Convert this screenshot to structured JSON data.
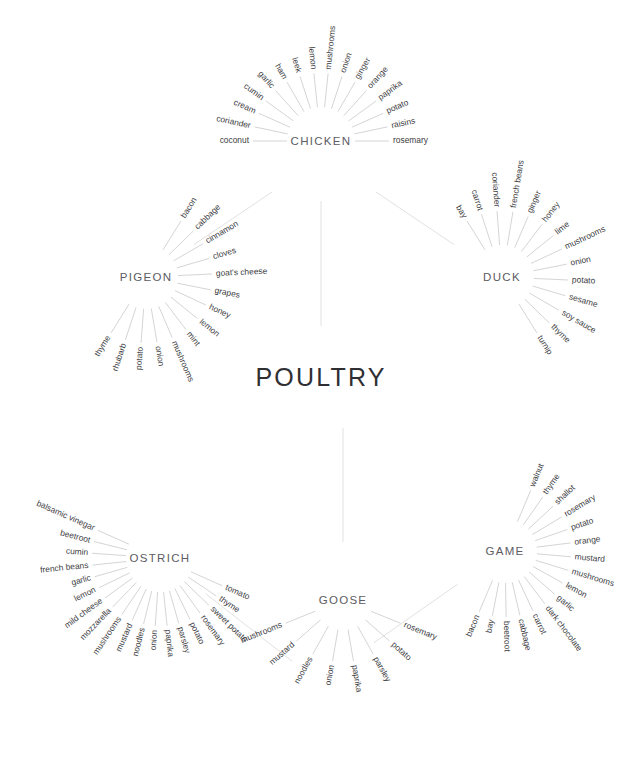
{
  "center": {
    "label": "POULTRY",
    "x": 321,
    "y": 378
  },
  "colors": {
    "background": "#ffffff",
    "center_text": "#2f2f33",
    "cluster_text": "#5c5c62",
    "ingredient_text": "#3c3c42",
    "spoke_line": "#b9b9bd",
    "connector_line": "#dededf"
  },
  "chart_data": {
    "type": "radial-tree",
    "title": "POULTRY",
    "legend": "none",
    "grid": false,
    "cluster_count": 6,
    "clusters": [
      {
        "name": "CHICKEN",
        "cx": 321,
        "cy": 141,
        "label_dx": 0,
        "label_dy": 4,
        "radius_inner": 34,
        "radius_outer": 68,
        "start_angle": 180,
        "end_angle": 360,
        "connector_angle": 90,
        "connector_from": 60,
        "connector_to": 185,
        "count": 16,
        "items": [
          "coconut",
          "coriander",
          "cream",
          "cumin",
          "garlic",
          "ham",
          "leek",
          "lemon",
          "mushrooms",
          "onion",
          "ginger",
          "orange",
          "paprika",
          "potato",
          "raisins",
          "rosemary"
        ]
      },
      {
        "name": "DUCK",
        "cx": 502,
        "cy": 277,
        "label_dx": 0,
        "label_dy": 4,
        "radius_inner": 32,
        "radius_outer": 66,
        "start_angle": 238,
        "end_angle": 418,
        "connector_angle": 214,
        "connector_from": 58,
        "connector_to": 152,
        "count": 14,
        "items": [
          "bay",
          "carrot",
          "coriander",
          "french beans",
          "ginger",
          "honey",
          "lime",
          "mushrooms",
          "onion",
          "potato",
          "sesame",
          "soy sauce",
          "thyme",
          "turnip"
        ]
      },
      {
        "name": "PIGEON",
        "cx": 146,
        "cy": 277,
        "label_dx": 0,
        "label_dy": 4,
        "radius_inner": 32,
        "radius_outer": 66,
        "start_angle": 302,
        "end_angle": 122,
        "connector_angle": 326,
        "connector_from": 58,
        "connector_to": 152,
        "count": 14,
        "items": [
          "bacon",
          "cabbage",
          "cinnamon",
          "cloves",
          "goat's cheese",
          "grapes",
          "honey",
          "lemon",
          "mint",
          "mushrooms",
          "onion",
          "potato",
          "rhubarb",
          "thyme"
        ]
      },
      {
        "name": "OSTRICH",
        "cx": 160,
        "cy": 558,
        "label_dx": 0,
        "label_dy": 4,
        "radius_inner": 34,
        "radius_outer": 68,
        "start_angle": 24,
        "end_angle": 204,
        "connector_angle": 38,
        "connector_from": 58,
        "connector_to": 168,
        "count": 19,
        "items": [
          "tomato",
          "thyme",
          "sweet potato",
          "rosemary",
          "potato",
          "parsley",
          "paprika",
          "onion",
          "noodles",
          "mustard",
          "mushrooms",
          "mozzarella",
          "mild cheese",
          "lemon",
          "garlic",
          "french beans",
          "cumin",
          "beetroot",
          "balsamic vinegar"
        ]
      },
      {
        "name": "GOOSE",
        "cx": 343,
        "cy": 600,
        "label_dx": 0,
        "label_dy": 4,
        "radius_inner": 30,
        "radius_outer": 62,
        "start_angle": 22,
        "end_angle": 158,
        "connector_angle": 270,
        "connector_from": 58,
        "connector_to": 172,
        "count": 8,
        "items": [
          "rosemary",
          "potato",
          "parsley",
          "paprika",
          "onion",
          "noodles",
          "mustard",
          "mushrooms"
        ]
      },
      {
        "name": "GAME",
        "cx": 505,
        "cy": 551,
        "label_dx": 0,
        "label_dy": 4,
        "radius_inner": 32,
        "radius_outer": 66,
        "start_angle": 293,
        "end_angle": 113,
        "connector_angle": 145,
        "connector_from": 58,
        "connector_to": 160,
        "count": 16,
        "items": [
          "walnut",
          "thyme",
          "shallot",
          "rosemary",
          "potato",
          "orange",
          "mustard",
          "mushrooms",
          "lemon",
          "garlic",
          "dark chocolate",
          "carrot",
          "cabbage",
          "beetroot",
          "bay",
          "bacon"
        ]
      }
    ]
  }
}
